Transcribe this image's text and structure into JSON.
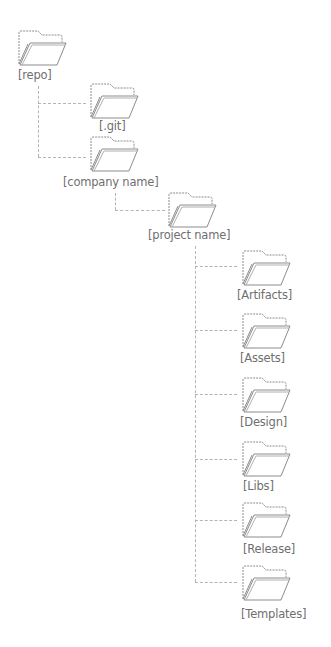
{
  "diagram": {
    "type": "folder-tree",
    "colors": {
      "folder_stroke": "#8c8c8c",
      "label_text": "#6f6f6f",
      "connector": "#b4b4b4"
    },
    "nodes": {
      "repo": {
        "label": "[repo]",
        "icon": "folder-open-icon"
      },
      "git": {
        "label": "[.git]",
        "icon": "folder-open-icon"
      },
      "company": {
        "label": "[company name]",
        "icon": "folder-open-icon"
      },
      "project": {
        "label": "[project name]",
        "icon": "folder-open-icon"
      },
      "artifacts": {
        "label": "[Artifacts]",
        "icon": "folder-open-icon"
      },
      "assets": {
        "label": "[Assets]",
        "icon": "folder-open-icon"
      },
      "design": {
        "label": "[Design]",
        "icon": "folder-open-icon"
      },
      "libs": {
        "label": "[Libs]",
        "icon": "folder-open-icon"
      },
      "release": {
        "label": "[Release]",
        "icon": "folder-open-icon"
      },
      "templates": {
        "label": "[Templates]",
        "icon": "folder-open-icon"
      }
    },
    "edges": [
      [
        "repo",
        "git"
      ],
      [
        "repo",
        "company"
      ],
      [
        "company",
        "project"
      ],
      [
        "project",
        "artifacts"
      ],
      [
        "project",
        "assets"
      ],
      [
        "project",
        "design"
      ],
      [
        "project",
        "libs"
      ],
      [
        "project",
        "release"
      ],
      [
        "project",
        "templates"
      ]
    ]
  }
}
